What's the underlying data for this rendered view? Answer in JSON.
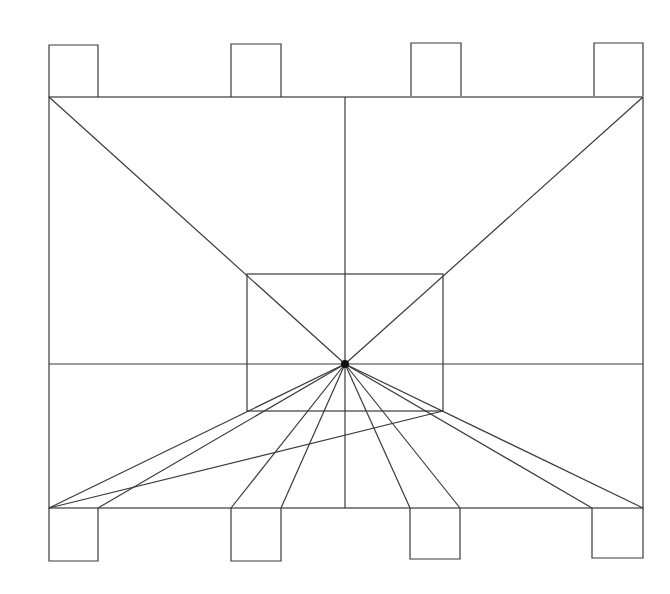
{
  "diagram": {
    "title": "",
    "stroke_color": "#3a3a3a",
    "background": "#ffffff",
    "outer_frame": {
      "x1": 49,
      "y1": 97,
      "x2": 643,
      "y2": 508
    },
    "inner_rect": {
      "x1": 247,
      "y1": 274,
      "x2": 443,
      "y2": 411
    },
    "vanishing_point": {
      "x": 345,
      "y": 364
    },
    "horizon_y": 364,
    "center_x": 345,
    "top_tabs": [
      {
        "x1": 49,
        "x2": 98,
        "y1": 45,
        "y2": 97
      },
      {
        "x1": 231,
        "x2": 281,
        "y1": 44,
        "y2": 97
      },
      {
        "x1": 411,
        "x2": 461,
        "y1": 43,
        "y2": 96
      },
      {
        "x1": 594,
        "x2": 643,
        "y1": 43,
        "y2": 96
      }
    ],
    "bottom_tabs": [
      {
        "x1": 49,
        "x2": 98,
        "y1": 508,
        "y2": 561
      },
      {
        "x1": 231,
        "x2": 281,
        "y1": 508,
        "y2": 561
      },
      {
        "x1": 410,
        "x2": 460,
        "y1": 508,
        "y2": 559
      },
      {
        "x1": 592,
        "x2": 643,
        "y1": 508,
        "y2": 558
      }
    ],
    "converging_lines_bottom_x": [
      49,
      98,
      231,
      281,
      410,
      460,
      592,
      643
    ],
    "cross_line": {
      "x1": 49,
      "y1": 508,
      "x2": 443,
      "y2": 411
    }
  }
}
